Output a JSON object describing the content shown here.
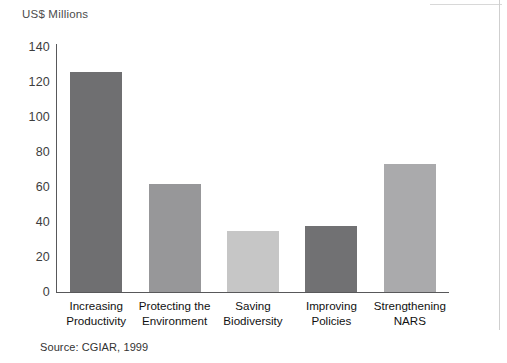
{
  "figure": {
    "source_note": "Source: CGIAR, 1999"
  },
  "chart_data": {
    "type": "bar",
    "title": "",
    "subtitle": "",
    "xlabel": "",
    "ylabel": "US$ Millions",
    "ylim": [
      0,
      140
    ],
    "yticks": [
      0,
      20,
      40,
      60,
      80,
      100,
      120,
      140
    ],
    "ytick_labels": [
      "0",
      "20",
      "40",
      "60",
      "80",
      "100",
      "120",
      "140"
    ],
    "grid": false,
    "legend": "none",
    "categories": [
      "Increasing Productivity",
      "Protecting the Environment",
      "Saving Biodiversity",
      "Improving Policies",
      "Strengthening NARS"
    ],
    "category_lines": [
      [
        "Increasing",
        "Productivity"
      ],
      [
        "Protecting the",
        "Environment"
      ],
      [
        "Saving",
        "Biodiversity"
      ],
      [
        "Improving",
        "Policies"
      ],
      [
        "Strengthening",
        "NARS"
      ]
    ],
    "values": [
      126,
      62,
      35,
      38,
      73
    ],
    "colors": [
      "#6f6f71",
      "#979799",
      "#c6c6c6",
      "#717173",
      "#aaaaac"
    ]
  }
}
